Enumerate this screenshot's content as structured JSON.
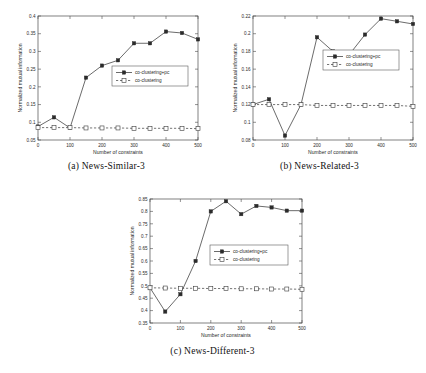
{
  "figure": {
    "background": "#ffffff",
    "line_color": "#3a3a3a",
    "panels": [
      {
        "id": "a",
        "caption": "(a) News-Similar-3",
        "chart_data": {
          "type": "line",
          "title": "",
          "xlabel": "Number of constraints",
          "ylabel": "Normalized mutual information",
          "xlim": [
            0,
            500
          ],
          "ylim": [
            0.05,
            0.4
          ],
          "xticks": [
            0,
            100,
            200,
            300,
            400,
            500
          ],
          "yticks": [
            0.05,
            0.1,
            0.15,
            0.2,
            0.25,
            0.3,
            0.35,
            0.4
          ],
          "xticklabels": [
            "0",
            "100",
            "200",
            "300",
            "400",
            "500"
          ],
          "yticklabels": [
            "0.05",
            "0.1",
            "0.15",
            "0.2",
            "0.25",
            "0.3",
            "0.35",
            "0.4"
          ],
          "grid": false,
          "legend_position": "center-right",
          "x": [
            0,
            50,
            100,
            150,
            200,
            250,
            300,
            350,
            400,
            450,
            500
          ],
          "series": [
            {
              "name": "co-clustering+pc",
              "marker": "filled-square",
              "linestyle": "solid",
              "values": [
                0.088,
                0.114,
                0.084,
                0.226,
                0.26,
                0.275,
                0.323,
                0.323,
                0.356,
                0.352,
                0.334
              ]
            },
            {
              "name": "co-clustering",
              "marker": "open-square",
              "linestyle": "dashed",
              "values": [
                0.085,
                0.085,
                0.085,
                0.084,
                0.084,
                0.084,
                0.083,
                0.083,
                0.083,
                0.083,
                0.082
              ]
            }
          ]
        }
      },
      {
        "id": "b",
        "caption": "(b) News-Related-3",
        "chart_data": {
          "type": "line",
          "title": "",
          "xlabel": "Number of constraints",
          "ylabel": "Normalized mutual information",
          "xlim": [
            0,
            500
          ],
          "ylim": [
            0.08,
            0.22
          ],
          "xticks": [
            0,
            100,
            200,
            300,
            400,
            500
          ],
          "yticks": [
            0.08,
            0.1,
            0.12,
            0.14,
            0.16,
            0.18,
            0.2,
            0.22
          ],
          "xticklabels": [
            "0",
            "100",
            "200",
            "300",
            "400",
            "500"
          ],
          "yticklabels": [
            "0.08",
            "0.1",
            "0.12",
            "0.14",
            "0.16",
            "0.18",
            "0.2",
            "0.22"
          ],
          "grid": false,
          "legend_position": "center-right",
          "x": [
            0,
            50,
            100,
            150,
            200,
            250,
            300,
            350,
            400,
            450,
            500
          ],
          "series": [
            {
              "name": "co-clustering+pc",
              "marker": "filled-square",
              "linestyle": "solid",
              "values": [
                0.12,
                0.126,
                0.085,
                0.12,
                0.196,
                0.18,
                0.176,
                0.199,
                0.217,
                0.214,
                0.211
              ]
            },
            {
              "name": "co-clustering",
              "marker": "open-square",
              "linestyle": "dashed",
              "values": [
                0.12,
                0.12,
                0.12,
                0.12,
                0.119,
                0.119,
                0.119,
                0.119,
                0.119,
                0.119,
                0.118
              ]
            }
          ]
        }
      },
      {
        "id": "c",
        "caption": "(c) News-Different-3",
        "chart_data": {
          "type": "line",
          "title": "",
          "xlabel": "Number of constraints",
          "ylabel": "Normalized mutual information",
          "xlim": [
            0,
            500
          ],
          "ylim": [
            0.35,
            0.85
          ],
          "xticks": [
            0,
            100,
            200,
            300,
            400,
            500
          ],
          "yticks": [
            0.35,
            0.4,
            0.45,
            0.5,
            0.55,
            0.6,
            0.65,
            0.7,
            0.75,
            0.8,
            0.85
          ],
          "xticklabels": [
            "0",
            "100",
            "200",
            "300",
            "400",
            "500"
          ],
          "yticklabels": [
            "0.35",
            "0.4",
            "0.45",
            "0.5",
            "0.55",
            "0.6",
            "0.65",
            "0.7",
            "0.75",
            "0.8",
            "0.85"
          ],
          "grid": false,
          "legend_position": "center-right",
          "x": [
            0,
            50,
            100,
            150,
            200,
            250,
            300,
            350,
            400,
            450,
            500
          ],
          "series": [
            {
              "name": "co-clustering+pc",
              "marker": "filled-square",
              "linestyle": "solid",
              "values": [
                0.492,
                0.396,
                0.466,
                0.6,
                0.8,
                0.841,
                0.789,
                0.822,
                0.816,
                0.803,
                0.803
              ]
            },
            {
              "name": "co-clustering",
              "marker": "open-square",
              "linestyle": "dashed",
              "values": [
                0.492,
                0.491,
                0.49,
                0.49,
                0.489,
                0.489,
                0.488,
                0.488,
                0.487,
                0.487,
                0.486
              ]
            }
          ]
        }
      }
    ]
  }
}
